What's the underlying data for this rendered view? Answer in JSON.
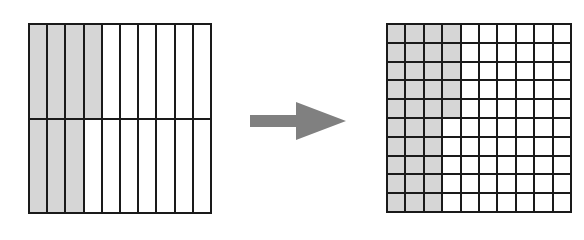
{
  "diagram": {
    "colors": {
      "shaded": "#d6d6d6",
      "unshaded": "#ffffff",
      "line": "#1a1a1a",
      "arrow": "#808080"
    },
    "left_grid": {
      "rows": 2,
      "cols": 10,
      "shaded_per_row": [
        4,
        3
      ],
      "shaded_total": 7,
      "total": 20
    },
    "arrow": {
      "direction": "right",
      "icon": "arrow-right-icon"
    },
    "right_grid": {
      "rows": 10,
      "cols": 10,
      "shaded_per_row": [
        4,
        4,
        4,
        4,
        4,
        3,
        3,
        3,
        3,
        3
      ],
      "shaded_total": 35,
      "total": 100
    }
  }
}
